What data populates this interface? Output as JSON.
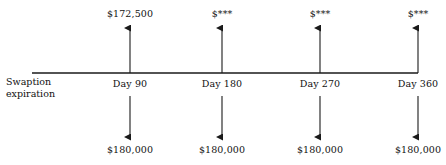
{
  "diagram": {
    "axis_label": {
      "line1": "Swaption",
      "line2": "expiration"
    },
    "colors": {
      "line": "#1a1a1a",
      "text": "#111111",
      "background": "#ffffff"
    },
    "timeline": {
      "y": 73,
      "x_start": 32,
      "x_end": 418
    },
    "nodes": [
      {
        "id": "day-90",
        "day_label": "Day 90",
        "inflow_label": "$172,500",
        "outflow_label": "$180,000",
        "x": 130
      },
      {
        "id": "day-180",
        "day_label": "Day 180",
        "inflow_label": "$***",
        "outflow_label": "$180,000",
        "x": 222
      },
      {
        "id": "day-270",
        "day_label": "Day 270",
        "inflow_label": "$***",
        "outflow_label": "$180,000",
        "x": 320
      },
      {
        "id": "day-360",
        "day_label": "Day 360",
        "inflow_label": "$***",
        "outflow_label": "$180,000",
        "x": 418
      }
    ],
    "geometry": {
      "arrow_up_top": 25,
      "arrow_down_bottom": 140,
      "inflow_text_y": 8,
      "day_text_y": 78,
      "outflow_text_y": 144
    }
  }
}
